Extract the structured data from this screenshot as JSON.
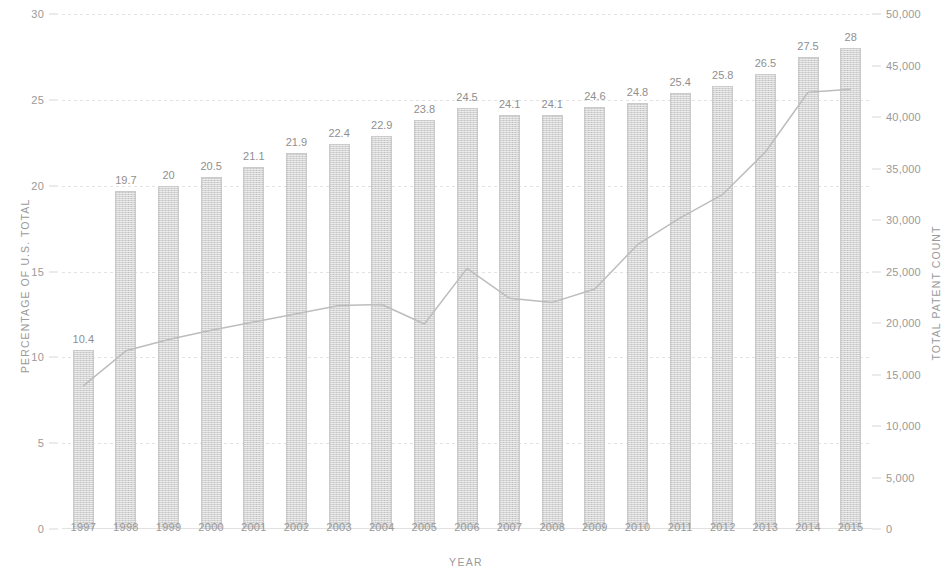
{
  "chart_data": {
    "type": "bar",
    "title": "",
    "xlabel": "YEAR",
    "ylabel": "PERCENTAGE OF U.S. TOTAL",
    "y2label": "TOTAL PATENT COUNT",
    "categories": [
      "1997",
      "1998",
      "1999",
      "2000",
      "2001",
      "2002",
      "2003",
      "2004",
      "2005",
      "2006",
      "2007",
      "2008",
      "2009",
      "2010",
      "2011",
      "2012",
      "2013",
      "2014",
      "2015"
    ],
    "ylim": [
      0,
      30
    ],
    "y2lim": [
      0,
      50000
    ],
    "yticks": [
      "0",
      "5",
      "10",
      "15",
      "20",
      "25",
      "30"
    ],
    "y2ticks": [
      "0",
      "5,000",
      "10,000",
      "15,000",
      "20,000",
      "25,000",
      "30,000",
      "35,000",
      "40,000",
      "45,000",
      "50,000"
    ],
    "grid": true,
    "legend": "none",
    "series": [
      {
        "name": "Percentage of U.S. total",
        "type": "bar",
        "axis": "left",
        "color": "#d4d4d4",
        "values": [
          10.4,
          19.7,
          20,
          20.5,
          21.1,
          21.9,
          22.4,
          22.9,
          23.8,
          24.5,
          24.1,
          24.1,
          24.6,
          24.8,
          25.4,
          25.8,
          26.5,
          27.5,
          28
        ],
        "labels": [
          "10.4",
          "19.7",
          "20",
          "20.5",
          "21.1",
          "21.9",
          "22.4",
          "22.9",
          "23.8",
          "24.5",
          "24.1",
          "24.1",
          "24.6",
          "24.8",
          "25.4",
          "25.8",
          "26.5",
          "27.5",
          "28"
        ]
      },
      {
        "name": "Total patent count",
        "type": "line",
        "axis": "right",
        "color": "#bdbdbd",
        "values": [
          13900,
          17300,
          18400,
          19300,
          20100,
          20900,
          21700,
          21800,
          19900,
          25300,
          22400,
          22000,
          23300,
          27600,
          30200,
          32500,
          36600,
          42400,
          42700
        ]
      }
    ]
  }
}
